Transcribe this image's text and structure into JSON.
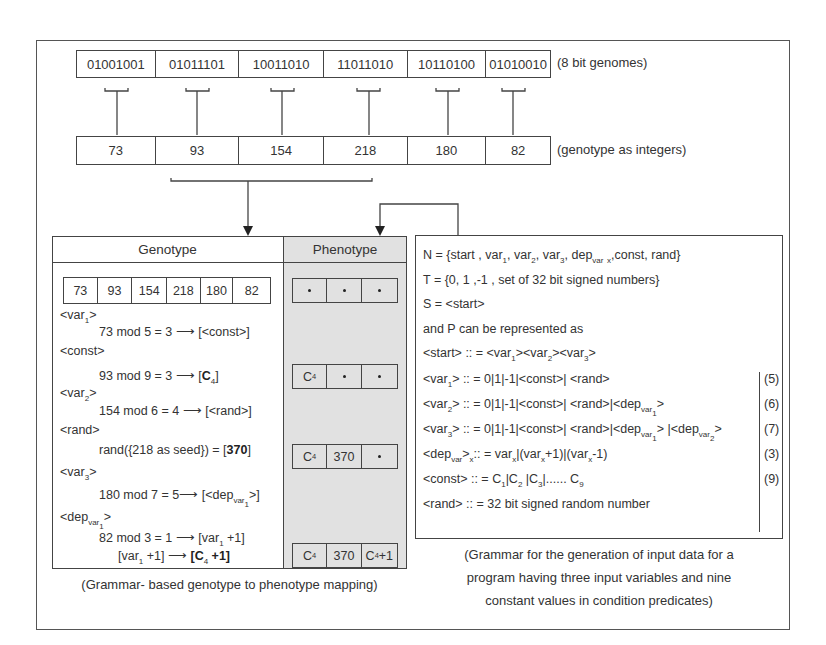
{
  "genomes": {
    "binary": [
      "01001001",
      "01011101",
      "10011010",
      "11011010",
      "10110100",
      "01010010"
    ],
    "binary_label": "(8 bit genomes)",
    "integers": [
      "73",
      "93",
      "154",
      "218",
      "180",
      "82"
    ],
    "integers_label": "(genotype as integers)"
  },
  "left_panel": {
    "genotype_header": "Genotype",
    "phenotype_header": "Phenotype",
    "genotype_values": [
      "73",
      "93",
      "154",
      "218",
      "180",
      "82"
    ],
    "steps": [
      {
        "nonterminal": "<var",
        "sub": "1",
        "close": ">",
        "rule": "73 mod 5 = 3",
        "result": "[<const>]"
      },
      {
        "nonterminal": "<const>",
        "rule": "93 mod 9 = 3",
        "result_pre": "[",
        "result_bold": "C",
        "result_sub": "4",
        "result_post": "]"
      },
      {
        "nonterminal": "<var",
        "sub": "2",
        "close": ">",
        "rule": "154 mod 6 = 4",
        "result": "[<rand>]"
      },
      {
        "nonterminal": "<rand>",
        "rule_pre": "rand({218 as seed}) = [",
        "rule_bold": "370",
        "rule_post": "]"
      },
      {
        "nonterminal": "<var",
        "sub": "3",
        "close": ">",
        "rule": "180 mod 7 = 5",
        "result_pre": "[<dep",
        "result_sub": "var",
        "result_subsub": "1",
        "result_post": ">]"
      },
      {
        "nonterminal": "<dep",
        "sub": "var",
        "subsub": "1",
        "close": ">",
        "rule": "82 mod 3 = 1",
        "result_pre": "[var",
        "result_sub": "1",
        "result_post": " +1]"
      },
      {
        "rule_pre": "[var",
        "rule_sub": "1",
        "rule_post": " +1]",
        "result_bold_pre": "[",
        "result_bold": "C",
        "result_sub": "4",
        "result_bold_post": " +1]"
      }
    ],
    "phenotype_states": [
      [
        "•",
        "•",
        "•"
      ],
      [
        "C4",
        "•",
        "•"
      ],
      [
        "C4",
        "370",
        "•"
      ],
      [
        "C4",
        "370",
        "C4+1"
      ]
    ],
    "caption": "(Grammar- based genotype to phenotype mapping)"
  },
  "right_panel": {
    "N": "N = {start , var1, var2, var3, dep var x ,const, rand}",
    "T": "T = {0, 1 ,-1 , set of 32 bit signed numbers}",
    "S": "S = <start>",
    "P_intro": "and P can be represented as",
    "productions": [
      {
        "lhs": "<start>",
        "rhs": "<var1><var2><var3>",
        "count": ""
      },
      {
        "lhs": "<var1>",
        "rhs": "0|1|-1|<const>| <rand>",
        "count": "(5)"
      },
      {
        "lhs": "<var2>",
        "rhs": "0|1|-1|<const>| <rand>|<dep var1>",
        "count": "(6)"
      },
      {
        "lhs": "<var3>",
        "rhs": "0|1|-1|<const>| <rand>|<dep var1> |<dep var2>",
        "count": "(7)"
      },
      {
        "lhs": "<dep var x>",
        "rhs": "varx|(varx+1)|(varx-1)",
        "count": "(3)"
      },
      {
        "lhs": "<const>",
        "rhs": "C1|C2 |C3|...... C9",
        "count": "(9)"
      },
      {
        "lhs": "<rand>",
        "rhs": "32 bit signed random number",
        "count": ""
      }
    ],
    "caption_lines": [
      "(Grammar for the generation of input data for a",
      "program having three input variables and nine",
      "constant values in condition predicates)"
    ]
  }
}
